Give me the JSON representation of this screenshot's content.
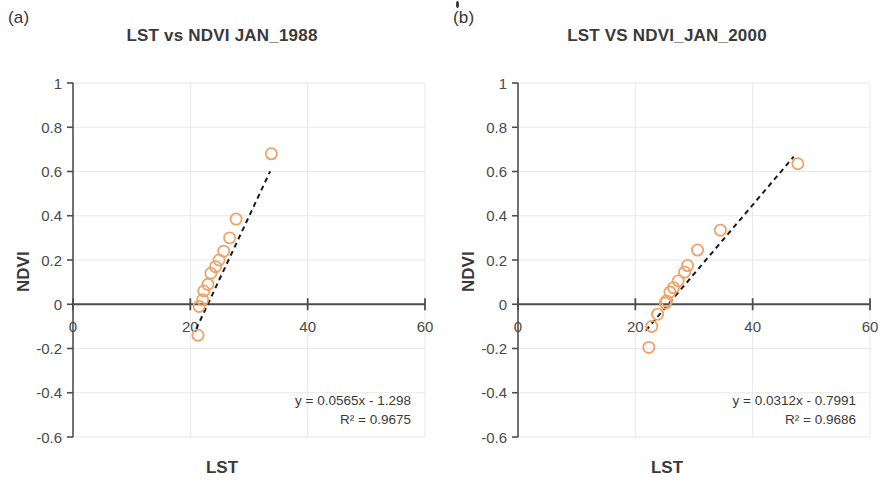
{
  "figure": {
    "background": "#ffffff",
    "marker_color": "#efa269",
    "axis_color": "#4d4d4d",
    "grid_color": "#e8e8ea",
    "trend_color": "#1a1a1a"
  },
  "panels": [
    {
      "id": "a",
      "label": "(a)",
      "chart_data": {
        "type": "scatter",
        "title": "LST vs NDVI JAN_1988",
        "xlabel": "LST",
        "ylabel": "NDVI",
        "xlim": [
          0,
          60
        ],
        "ylim": [
          -0.6,
          1
        ],
        "xticks": [
          0,
          20,
          40,
          60
        ],
        "yticks": [
          -0.6,
          -0.4,
          -0.2,
          0,
          0.2,
          0.4,
          0.6,
          0.8,
          1
        ],
        "xtick_labels": [
          "0",
          "20",
          "40",
          "60"
        ],
        "ytick_labels": [
          "-0.6",
          "-0.4",
          "-0.2",
          "0",
          "0.2",
          "0.4",
          "0.6",
          "0.8",
          "1"
        ],
        "grid": true,
        "legend": "none",
        "marker": "open-circle",
        "marker_color": "#efa269",
        "series": [
          {
            "name": "LST vs NDVI JAN_1988",
            "points": [
              [
                21.3,
                -0.14
              ],
              [
                21.5,
                -0.01
              ],
              [
                22.1,
                0.02
              ],
              [
                22.3,
                0.06
              ],
              [
                23.0,
                0.09
              ],
              [
                23.5,
                0.14
              ],
              [
                24.3,
                0.17
              ],
              [
                24.9,
                0.2
              ],
              [
                25.7,
                0.24
              ],
              [
                26.7,
                0.3
              ],
              [
                27.8,
                0.385
              ],
              [
                33.8,
                0.68
              ]
            ]
          }
        ],
        "trendline": {
          "style": "dashed",
          "color": "#1a1a1a",
          "slope": 0.0565,
          "intercept": -1.298,
          "x_start": 21.0,
          "x_end": 33.6,
          "equation": "y = 0.0565x - 1.298",
          "r_squared_label": "R² = 0.9675",
          "r_squared": 0.9675
        },
        "annotations": [
          "y = 0.0565x - 1.298",
          "R² = 0.9675"
        ]
      }
    },
    {
      "id": "b",
      "label": "(b)",
      "chart_data": {
        "type": "scatter",
        "title": "LST VS NDVI_JAN_2000",
        "xlabel": "LST",
        "ylabel": "NDVI",
        "xlim": [
          0,
          60
        ],
        "ylim": [
          -0.6,
          1
        ],
        "xticks": [
          0,
          20,
          40,
          60
        ],
        "yticks": [
          -0.6,
          -0.4,
          -0.2,
          0,
          0.2,
          0.4,
          0.6,
          0.8,
          1
        ],
        "xtick_labels": [
          "0",
          "20",
          "40",
          "60"
        ],
        "ytick_labels": [
          "-0.6",
          "-0.4",
          "-0.2",
          "0",
          "0.2",
          "0.4",
          "0.6",
          "0.8",
          "1"
        ],
        "grid": true,
        "legend": "none",
        "marker": "open-circle",
        "marker_color": "#efa269",
        "series": [
          {
            "name": "LST VS NDVI_JAN_2000",
            "points": [
              [
                22.3,
                -0.195
              ],
              [
                22.8,
                -0.1
              ],
              [
                23.8,
                -0.045
              ],
              [
                25.1,
                0.005
              ],
              [
                25.3,
                0.015
              ],
              [
                25.9,
                0.055
              ],
              [
                26.5,
                0.075
              ],
              [
                27.3,
                0.105
              ],
              [
                28.4,
                0.145
              ],
              [
                28.9,
                0.175
              ],
              [
                30.6,
                0.245
              ],
              [
                34.5,
                0.335
              ],
              [
                47.7,
                0.635
              ]
            ]
          }
        ],
        "trendline": {
          "style": "dashed",
          "color": "#1a1a1a",
          "slope": 0.0312,
          "intercept": -0.7991,
          "x_start": 21.8,
          "x_end": 47.0,
          "equation": "y = 0.0312x - 0.7991",
          "r_squared_label": "R² = 0.9686",
          "r_squared": 0.9686
        },
        "annotations": [
          "y = 0.0312x - 0.7991",
          "R² = 0.9686"
        ]
      }
    }
  ]
}
